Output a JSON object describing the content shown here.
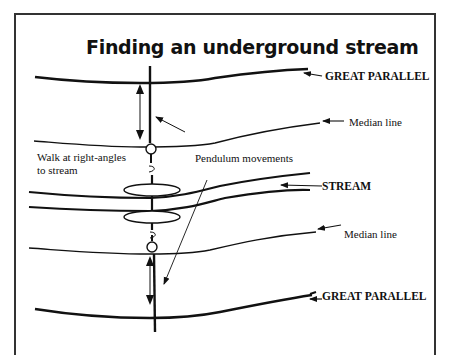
{
  "diagram": {
    "title": "Finding an underground stream",
    "labels": {
      "great_parallel_top": "GREAT PARALLEL",
      "median_line_top": "Median line",
      "walk_line1": "Walk at right-angles",
      "walk_line2": "to stream",
      "pendulum": "Pendulum movements",
      "stream": "STREAM",
      "median_line_bottom": "Median line",
      "great_parallel_bottom": "GREAT PARALLEL"
    },
    "colors": {
      "ink": "#111111",
      "frame": "#333333",
      "background": "#ffffff"
    }
  }
}
